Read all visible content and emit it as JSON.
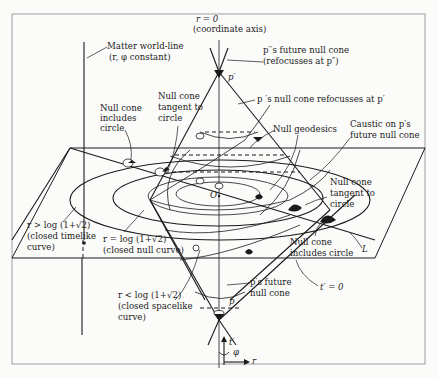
{
  "figure": {
    "labels": {
      "axis_r0": "r = 0",
      "axis_r0_note": "(coordinate axis)",
      "matter_worldline": "Matter world-line",
      "matter_worldline_note": "(r, φ constant)",
      "pprime_future_cone": "p′′s future null cone",
      "pprime_future_cone_note": "(refocusses at p″)",
      "pprime": "p′",
      "p_cone_refocusses": "p ′s null cone refocusses at p′",
      "null_cone_includes_circle_1": [
        "Null cone",
        "includes",
        "circle"
      ],
      "null_cone_tangent_1": [
        "Null cone",
        "tangent to",
        "circle"
      ],
      "null_geodesics": "Null geodesics",
      "caustic": [
        "Caustic on p′s",
        "future null cone"
      ],
      "origin": "O",
      "null_cone_tangent_2": [
        "Null cone",
        "tangent to",
        "circle"
      ],
      "null_cone_includes_circle_2": [
        "Null cone",
        "includes circle"
      ],
      "line_L": "L",
      "timelike": [
        "r > log (1+√2)",
        "(closed timelike",
        "curve)"
      ],
      "null_curve": [
        "r = log (1+√2)",
        "(closed null curve)"
      ],
      "spacelike": [
        "r < log (1+√2)",
        "(closed spacelike",
        "curve)"
      ],
      "p_future_cone": [
        "p′s future",
        "null cone"
      ],
      "p": "p",
      "t_zero": "t′ = 0",
      "axis_t": "t′",
      "axis_phi": "φ",
      "axis_r": "r"
    }
  }
}
